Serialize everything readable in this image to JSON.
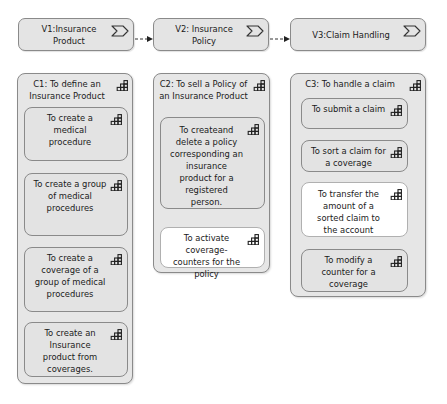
{
  "value_streams": [
    {
      "id": "V1",
      "label": "V1:Insurance Product",
      "icon": "value-stream-chevron-icon"
    },
    {
      "id": "V2",
      "label": "V2: Insurance Policy",
      "icon": "value-stream-chevron-icon"
    },
    {
      "id": "V3",
      "label": "V3:Claim Handling",
      "icon": "value-stream-chevron-icon"
    }
  ],
  "flows": [
    {
      "from": "V1",
      "to": "V2",
      "style": "dashed-arrow"
    },
    {
      "from": "V2",
      "to": "V3",
      "style": "dashed-arrow"
    }
  ],
  "capabilities": [
    {
      "id": "C1",
      "title": "C1: To define an Insurance Product",
      "icon": "capability-grid-icon",
      "items": [
        {
          "label": "To create a medical procedure",
          "highlight": false
        },
        {
          "label": "To create a group of medical procedures",
          "highlight": false
        },
        {
          "label": "To create a coverage of  a group of medical procedures",
          "highlight": false
        },
        {
          "label": "To create an Insurance product from coverages.",
          "highlight": false
        }
      ]
    },
    {
      "id": "C2",
      "title": "C2: To sell a Policy of an Insurance Product",
      "icon": "capability-grid-icon",
      "items": [
        {
          "label": "To createand delete a policy corresponding an insurance product for a registered person.",
          "highlight": false
        },
        {
          "label": "To activate coverage-counters for the policy",
          "highlight": true
        }
      ]
    },
    {
      "id": "C3",
      "title": "C3: To handle a claim",
      "icon": "capability-grid-icon",
      "items": [
        {
          "label": "To submit a claim",
          "highlight": false
        },
        {
          "label": "To sort a claim for a coverage",
          "highlight": false
        },
        {
          "label": "To transfer the amount  of a sorted claim to the account",
          "highlight": true
        },
        {
          "label": "To modify a counter for a coverage",
          "highlight": false
        }
      ]
    }
  ],
  "colors": {
    "box_fill": "#e4e4e4",
    "highlight_fill": "#ffffff",
    "border": "#8a8a8a",
    "text": "#1a1a1a"
  }
}
